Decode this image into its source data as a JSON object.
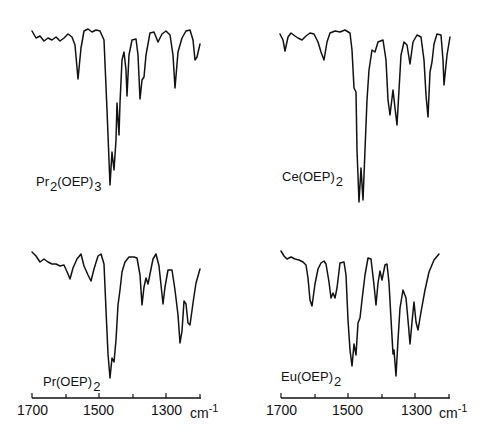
{
  "chart_data": [
    {
      "type": "line",
      "panel": "top-left",
      "title": "Pr2(OEP)3",
      "xlabel": "cm-1",
      "xlim": [
        1700,
        1200
      ],
      "x_ticks": [
        1700,
        1600,
        1500,
        1400,
        1300,
        1200
      ],
      "x_tick_labels_shown": false,
      "y_axis": "transmittance (arbitrary, no ticks)",
      "absorption_bands_cm-1": [
        1565,
        1468,
        1460,
        1450,
        1435,
        1420,
        1385,
        1375,
        1325,
        1270,
        1215
      ],
      "strongest_band_cm-1": 1465,
      "points_px": [
        [
          32,
          31
        ],
        [
          36,
          38
        ],
        [
          40,
          36
        ],
        [
          44,
          41
        ],
        [
          48,
          38
        ],
        [
          52,
          40
        ],
        [
          56,
          37
        ],
        [
          60,
          41
        ],
        [
          64,
          38
        ],
        [
          68,
          34
        ],
        [
          72,
          37
        ],
        [
          75,
          45
        ],
        [
          78,
          79
        ],
        [
          81,
          48
        ],
        [
          84,
          31
        ],
        [
          88,
          29
        ],
        [
          92,
          32
        ],
        [
          96,
          30
        ],
        [
          100,
          31
        ],
        [
          104,
          40
        ],
        [
          107,
          110
        ],
        [
          109,
          160
        ],
        [
          110,
          185
        ],
        [
          112,
          152
        ],
        [
          114,
          170
        ],
        [
          116,
          140
        ],
        [
          117,
          103
        ],
        [
          119,
          135
        ],
        [
          120,
          103
        ],
        [
          122,
          60
        ],
        [
          124,
          52
        ],
        [
          126,
          70
        ],
        [
          127,
          96
        ],
        [
          129,
          55
        ],
        [
          132,
          40
        ],
        [
          136,
          39
        ],
        [
          138,
          55
        ],
        [
          140,
          99
        ],
        [
          142,
          80
        ],
        [
          144,
          77
        ],
        [
          146,
          55
        ],
        [
          150,
          33
        ],
        [
          154,
          32
        ],
        [
          158,
          42
        ],
        [
          162,
          34
        ],
        [
          166,
          31
        ],
        [
          170,
          35
        ],
        [
          173,
          55
        ],
        [
          175,
          88
        ],
        [
          178,
          52
        ],
        [
          182,
          38
        ],
        [
          186,
          31
        ],
        [
          190,
          30
        ],
        [
          193,
          40
        ],
        [
          195,
          60
        ],
        [
          197,
          57
        ],
        [
          200,
          44
        ]
      ]
    },
    {
      "type": "line",
      "panel": "top-right",
      "title": "Ce(OEP)2",
      "xlabel": "cm-1",
      "xlim": [
        1700,
        1200
      ],
      "x_ticks": [
        1700,
        1600,
        1500,
        1400,
        1300,
        1200
      ],
      "x_tick_labels_shown": false,
      "absorption_bands_cm-1": [
        1685,
        1565,
        1470,
        1462,
        1380,
        1370,
        1360,
        1320,
        1290,
        1280,
        1225
      ],
      "strongest_band_cm-1": 1465,
      "points_px": [
        [
          280,
          34
        ],
        [
          283,
          40
        ],
        [
          285,
          51
        ],
        [
          288,
          37
        ],
        [
          291,
          33
        ],
        [
          295,
          36
        ],
        [
          298,
          38
        ],
        [
          302,
          40
        ],
        [
          306,
          36
        ],
        [
          310,
          33
        ],
        [
          314,
          34
        ],
        [
          318,
          42
        ],
        [
          321,
          52
        ],
        [
          324,
          60
        ],
        [
          327,
          42
        ],
        [
          330,
          33
        ],
        [
          335,
          31
        ],
        [
          340,
          32
        ],
        [
          345,
          30
        ],
        [
          350,
          33
        ],
        [
          352,
          50
        ],
        [
          354,
          88
        ],
        [
          356,
          92
        ],
        [
          357,
          150
        ],
        [
          359,
          202
        ],
        [
          361,
          168
        ],
        [
          363,
          200
        ],
        [
          365,
          150
        ],
        [
          367,
          100
        ],
        [
          369,
          70
        ],
        [
          372,
          50
        ],
        [
          375,
          52
        ],
        [
          378,
          42
        ],
        [
          383,
          40
        ],
        [
          386,
          60
        ],
        [
          388,
          100
        ],
        [
          390,
          115
        ],
        [
          393,
          90
        ],
        [
          395,
          108
        ],
        [
          397,
          125
        ],
        [
          399,
          90
        ],
        [
          401,
          55
        ],
        [
          404,
          42
        ],
        [
          407,
          45
        ],
        [
          410,
          64
        ],
        [
          413,
          42
        ],
        [
          417,
          35
        ],
        [
          421,
          37
        ],
        [
          424,
          60
        ],
        [
          426,
          95
        ],
        [
          428,
          117
        ],
        [
          430,
          72
        ],
        [
          432,
          62
        ],
        [
          434,
          44
        ],
        [
          437,
          34
        ],
        [
          441,
          35
        ],
        [
          443,
          60
        ],
        [
          444,
          85
        ],
        [
          447,
          55
        ],
        [
          450,
          37
        ]
      ]
    },
    {
      "type": "line",
      "panel": "bottom-left",
      "title": "Pr(OEP)2",
      "xlabel": "cm-1",
      "xlim": [
        1700,
        1200
      ],
      "x_ticks": [
        1700,
        1600,
        1500,
        1400,
        1300,
        1200
      ],
      "x_tick_labels": [
        "1700",
        "1500",
        "1300"
      ],
      "absorption_bands_cm-1": [
        1585,
        1520,
        1468,
        1458,
        1380,
        1362,
        1310,
        1255,
        1235
      ],
      "strongest_band_cm-1": 1468,
      "points_px": [
        [
          32,
          252
        ],
        [
          36,
          256
        ],
        [
          40,
          262
        ],
        [
          44,
          259
        ],
        [
          48,
          262
        ],
        [
          52,
          264
        ],
        [
          56,
          264
        ],
        [
          60,
          266
        ],
        [
          64,
          265
        ],
        [
          68,
          274
        ],
        [
          70,
          279
        ],
        [
          73,
          268
        ],
        [
          77,
          259
        ],
        [
          81,
          254
        ],
        [
          84,
          266
        ],
        [
          88,
          275
        ],
        [
          91,
          281
        ],
        [
          94,
          269
        ],
        [
          98,
          256
        ],
        [
          101,
          254
        ],
        [
          104,
          264
        ],
        [
          106,
          310
        ],
        [
          108,
          354
        ],
        [
          110,
          378
        ],
        [
          112,
          358
        ],
        [
          114,
          362
        ],
        [
          116,
          340
        ],
        [
          118,
          305
        ],
        [
          120,
          290
        ],
        [
          122,
          272
        ],
        [
          125,
          262
        ],
        [
          129,
          257
        ],
        [
          134,
          257
        ],
        [
          137,
          258
        ],
        [
          140,
          275
        ],
        [
          142,
          305
        ],
        [
          144,
          287
        ],
        [
          146,
          278
        ],
        [
          148,
          284
        ],
        [
          150,
          274
        ],
        [
          153,
          259
        ],
        [
          156,
          254
        ],
        [
          159,
          266
        ],
        [
          161,
          285
        ],
        [
          163,
          304
        ],
        [
          165,
          287
        ],
        [
          168,
          270
        ],
        [
          172,
          270
        ],
        [
          175,
          290
        ],
        [
          178,
          315
        ],
        [
          180,
          343
        ],
        [
          182,
          331
        ],
        [
          184,
          301
        ],
        [
          186,
          304
        ],
        [
          188,
          323
        ],
        [
          190,
          325
        ],
        [
          193,
          303
        ],
        [
          196,
          283
        ],
        [
          200,
          269
        ]
      ]
    },
    {
      "type": "line",
      "panel": "bottom-right",
      "title": "Eu(OEP)2",
      "xlabel": "cm-1",
      "xlim": [
        1700,
        1200
      ],
      "x_ticks": [
        1700,
        1600,
        1500,
        1400,
        1300,
        1200
      ],
      "x_tick_labels": [
        "1700",
        "1500",
        "1300"
      ],
      "absorption_bands_cm-1": [
        1605,
        1535,
        1520,
        1460,
        1450,
        1385,
        1365,
        1325,
        1310,
        1265,
        1240
      ],
      "strongest_band_cm-1": 1310,
      "points_px": [
        [
          281,
          251
        ],
        [
          284,
          256
        ],
        [
          287,
          259
        ],
        [
          291,
          257
        ],
        [
          295,
          259
        ],
        [
          299,
          260
        ],
        [
          303,
          262
        ],
        [
          306,
          265
        ],
        [
          308,
          278
        ],
        [
          310,
          300
        ],
        [
          312,
          306
        ],
        [
          315,
          284
        ],
        [
          318,
          269
        ],
        [
          321,
          263
        ],
        [
          324,
          261
        ],
        [
          326,
          264
        ],
        [
          329,
          282
        ],
        [
          331,
          298
        ],
        [
          333,
          293
        ],
        [
          335,
          298
        ],
        [
          337,
          288
        ],
        [
          340,
          263
        ],
        [
          344,
          262
        ],
        [
          346,
          275
        ],
        [
          348,
          320
        ],
        [
          350,
          350
        ],
        [
          352,
          366
        ],
        [
          354,
          344
        ],
        [
          356,
          355
        ],
        [
          358,
          323
        ],
        [
          360,
          318
        ],
        [
          362,
          300
        ],
        [
          365,
          275
        ],
        [
          368,
          258
        ],
        [
          371,
          259
        ],
        [
          374,
          285
        ],
        [
          376,
          305
        ],
        [
          378,
          283
        ],
        [
          380,
          271
        ],
        [
          382,
          280
        ],
        [
          385,
          265
        ],
        [
          387,
          264
        ],
        [
          389,
          283
        ],
        [
          391,
          319
        ],
        [
          393,
          354
        ],
        [
          394,
          350
        ],
        [
          396,
          376
        ],
        [
          398,
          340
        ],
        [
          400,
          308
        ],
        [
          403,
          290
        ],
        [
          406,
          298
        ],
        [
          408,
          320
        ],
        [
          410,
          344
        ],
        [
          412,
          322
        ],
        [
          414,
          302
        ],
        [
          416,
          322
        ],
        [
          418,
          330
        ],
        [
          421,
          312
        ],
        [
          425,
          290
        ],
        [
          429,
          272
        ],
        [
          434,
          260
        ],
        [
          439,
          254
        ]
      ]
    }
  ],
  "panels": {
    "top_left": {
      "label_main": "Pr",
      "label_sub1": "2",
      "label_mid": "(OEP)",
      "label_sub2": "3"
    },
    "top_right": {
      "label_main": "Ce(OEP)",
      "label_sub": "2"
    },
    "bottom_left": {
      "label_main": "Pr(OEP)",
      "label_sub": "2"
    },
    "bottom_right": {
      "label_main": "Eu(OEP)",
      "label_sub": "2"
    }
  },
  "axes": {
    "left": {
      "tick_labels": [
        "1700",
        "1500",
        "1300"
      ],
      "unit": "cm",
      "unit_exp": "-1"
    },
    "right": {
      "tick_labels": [
        "1700",
        "1500",
        "1300"
      ],
      "unit": "cm",
      "unit_exp": "-1"
    }
  }
}
